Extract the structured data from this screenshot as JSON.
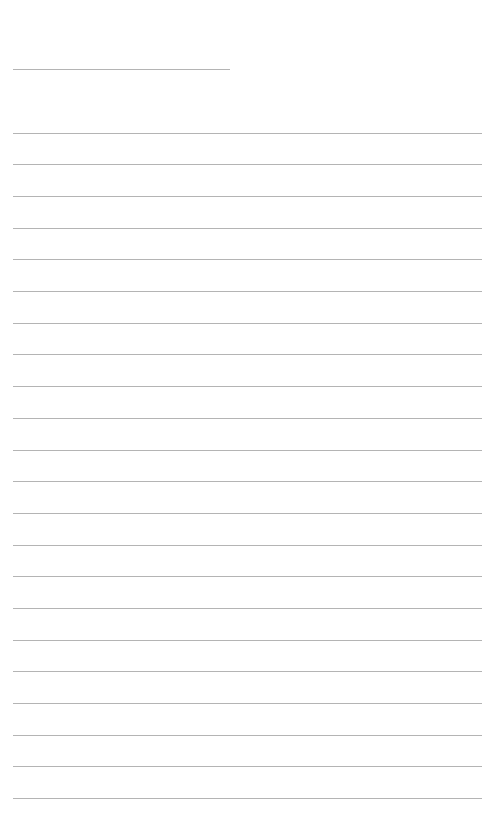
{
  "page": {
    "type": "blank lined notebook page",
    "background_color": "#ffffff",
    "line_color": "#b4b4b4"
  },
  "header_line": {
    "x": 13,
    "y": 69,
    "width": 217
  },
  "ruled_lines": {
    "count": 22,
    "x": 13,
    "width": 469,
    "first_y": 132.7,
    "spacing": 31.68
  }
}
